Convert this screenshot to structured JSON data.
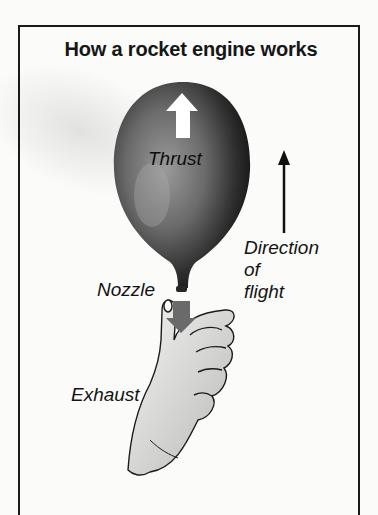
{
  "diagram": {
    "title": "How a rocket engine works",
    "labels": {
      "thrust": "Thrust",
      "direction_line1": "Direction",
      "direction_line2": "of",
      "direction_line3": "flight",
      "nozzle": "Nozzle",
      "exhaust": "Exhaust"
    },
    "icons": {
      "balloon": "balloon-illustration",
      "thrust_arrow": "white-up-arrow",
      "direction_arrow": "black-up-arrow",
      "exhaust_arrow": "grey-down-arrow",
      "hand": "hand-illustration"
    },
    "colors": {
      "balloon_dark": "#1e1e1e",
      "balloon_light": "#8a8a8a",
      "exhaust_arrow": "#6a6a6a",
      "border": "#1a1a1a",
      "background": "#fbfbfa"
    }
  }
}
